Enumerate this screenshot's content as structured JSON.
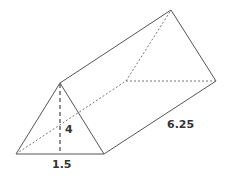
{
  "diagram": {
    "type": "triangular-prism",
    "labels": {
      "height": "4",
      "base": "1.5",
      "length": "6.25"
    },
    "colors": {
      "edge": "#555555",
      "hidden_edge": "#777777",
      "text": "#333333"
    }
  }
}
